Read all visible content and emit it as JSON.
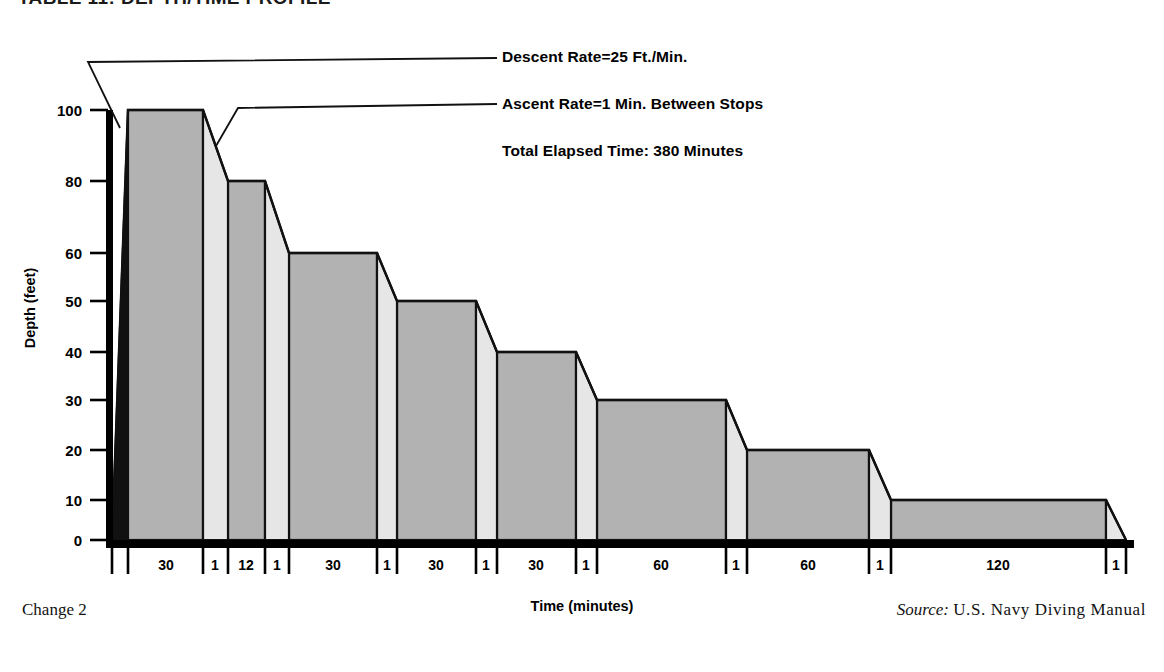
{
  "figure": {
    "title": "TABLE 11: DEPTH/TIME PROFILE",
    "change_note": "Change 2",
    "source_label": "Source:",
    "source_value": "U.S. Navy Diving Manual"
  },
  "annotations": {
    "descent_rate": "Descent Rate=25 Ft./Min.",
    "ascent_rate": "Ascent Rate=1 Min. Between Stops",
    "total_time": "Total Elapsed Time: 380 Minutes"
  },
  "axes": {
    "y_title": "Depth (feet)",
    "x_title": "Time (minutes)",
    "y_ticks": [
      {
        "label": "100",
        "value": 100,
        "y": 110
      },
      {
        "label": "80",
        "value": 80,
        "y": 181
      },
      {
        "label": "60",
        "value": 60,
        "y": 253
      },
      {
        "label": "50",
        "value": 50,
        "y": 301
      },
      {
        "label": "40",
        "value": 40,
        "y": 352
      },
      {
        "label": "30",
        "value": 30,
        "y": 400
      },
      {
        "label": "20",
        "value": 20,
        "y": 450
      },
      {
        "label": "10",
        "value": 10,
        "y": 500
      },
      {
        "label": "0",
        "value": 0,
        "y": 540
      }
    ],
    "x_segment_labels": [
      "30",
      "1",
      "12",
      "1",
      "30",
      "1",
      "30",
      "1",
      "30",
      "1",
      "60",
      "1",
      "60",
      "1",
      "120",
      "1"
    ]
  },
  "colors": {
    "plateau_fill": "#b2b2b2",
    "ascent_fill": "#e6e6e6",
    "outline": "#111111",
    "axis": "#000000",
    "background": "#ffffff"
  },
  "chart_data": {
    "type": "area",
    "title": "TABLE 11: DEPTH/TIME PROFILE",
    "xlabel": "Time (minutes)",
    "ylabel": "Depth (feet)",
    "ylim": [
      0,
      100
    ],
    "y_inverted": true,
    "grid": false,
    "legend": null,
    "total_elapsed_minutes": 380,
    "descent_rate_ft_per_min": 25,
    "ascent_rate_min_between_stops": 1,
    "segments": [
      {
        "kind": "descent",
        "label": "",
        "minutes": 4,
        "depth_from": 0,
        "depth_to": 100,
        "x0": 112,
        "x1": 128
      },
      {
        "kind": "bottom",
        "label": "30",
        "minutes": 30,
        "depth": 100,
        "x0": 128,
        "x1": 203
      },
      {
        "kind": "ascent",
        "label": "1",
        "minutes": 1,
        "depth_from": 100,
        "depth_to": 80,
        "x0": 203,
        "x1": 228
      },
      {
        "kind": "stop",
        "label": "12",
        "minutes": 12,
        "depth": 80,
        "x0": 228,
        "x1": 265
      },
      {
        "kind": "ascent",
        "label": "1",
        "minutes": 1,
        "depth_from": 80,
        "depth_to": 60,
        "x0": 265,
        "x1": 289
      },
      {
        "kind": "stop",
        "label": "30",
        "minutes": 30,
        "depth": 60,
        "x0": 289,
        "x1": 377
      },
      {
        "kind": "ascent",
        "label": "1",
        "minutes": 1,
        "depth_from": 60,
        "depth_to": 50,
        "x0": 377,
        "x1": 397
      },
      {
        "kind": "stop",
        "label": "30",
        "minutes": 30,
        "depth": 50,
        "x0": 397,
        "x1": 476
      },
      {
        "kind": "ascent",
        "label": "1",
        "minutes": 1,
        "depth_from": 50,
        "depth_to": 40,
        "x0": 476,
        "x1": 497
      },
      {
        "kind": "stop",
        "label": "30",
        "minutes": 30,
        "depth": 40,
        "x0": 497,
        "x1": 576
      },
      {
        "kind": "ascent",
        "label": "1",
        "minutes": 1,
        "depth_from": 40,
        "depth_to": 30,
        "x0": 576,
        "x1": 597
      },
      {
        "kind": "stop",
        "label": "30",
        "minutes": 30,
        "depth": 30,
        "x0": 597,
        "x1": 726
      },
      {
        "kind": "ascent",
        "label": "1",
        "minutes": 1,
        "depth_from": 30,
        "depth_to": 20,
        "x0": 726,
        "x1": 747
      },
      {
        "kind": "stop",
        "label": "60",
        "minutes": 60,
        "depth": 20,
        "x0": 747,
        "x1": 869
      },
      {
        "kind": "ascent",
        "label": "1",
        "minutes": 1,
        "depth_from": 20,
        "depth_to": 10,
        "x0": 869,
        "x1": 891
      },
      {
        "kind": "stop",
        "label": "60",
        "minutes": 60,
        "depth": 10,
        "x0": 891,
        "x1": 1106
      },
      {
        "kind": "ascent",
        "label": "1",
        "minutes": 1,
        "depth_from": 10,
        "depth_to": 0,
        "x0": 1106,
        "x1": 1126
      }
    ],
    "x_ticks": [
      112,
      128,
      203,
      228,
      265,
      289,
      377,
      397,
      476,
      497,
      576,
      597,
      726,
      747,
      869,
      891,
      1106,
      1126
    ],
    "x_labels": [
      {
        "text": "30",
        "x": 166
      },
      {
        "text": "1",
        "x": 215
      },
      {
        "text": "12",
        "x": 246
      },
      {
        "text": "1",
        "x": 277
      },
      {
        "text": "30",
        "x": 333
      },
      {
        "text": "1",
        "x": 387
      },
      {
        "text": "30",
        "x": 436
      },
      {
        "text": "1",
        "x": 486
      },
      {
        "text": "30",
        "x": 536
      },
      {
        "text": "1",
        "x": 586
      },
      {
        "text": "60",
        "x": 661
      },
      {
        "text": "1",
        "x": 736
      },
      {
        "text": "60",
        "x": 808
      },
      {
        "text": "1",
        "x": 880
      },
      {
        "text": "120",
        "x": 998
      },
      {
        "text": "1",
        "x": 1116
      }
    ]
  },
  "leaders": {
    "descent_leader_label": "descent-rate-leader",
    "ascent_leader_label": "ascent-rate-leader"
  }
}
